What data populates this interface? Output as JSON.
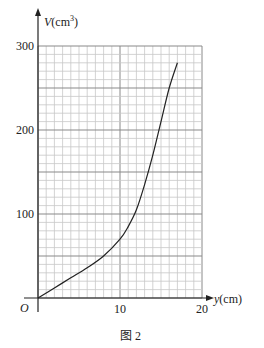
{
  "chart_data": {
    "type": "line",
    "title": "",
    "caption": "图 2",
    "xlabel": "y(cm)",
    "ylabel": "V(cm³)",
    "origin_label": "O",
    "xlim": [
      0,
      20
    ],
    "ylim": [
      0,
      300
    ],
    "x_ticks": [
      10,
      20
    ],
    "y_ticks": [
      100,
      200,
      300
    ],
    "x_tick_labels": [
      "10",
      "20"
    ],
    "y_tick_labels": [
      "100",
      "200",
      "300"
    ],
    "grid": true,
    "x_minor_step": 1,
    "y_minor_step": 10,
    "y_major_step": 50,
    "x_major_step": 10,
    "series": [
      {
        "name": "V",
        "x": [
          0,
          2,
          4,
          6,
          8,
          10,
          11,
          12,
          13,
          14,
          15,
          16,
          17
        ],
        "values": [
          0,
          12,
          24,
          36,
          50,
          70,
          85,
          105,
          135,
          170,
          210,
          250,
          280
        ]
      }
    ]
  },
  "colors": {
    "grid_minor": "#c8c8c8",
    "grid_major": "#8a8a8a",
    "axis": "#222222",
    "curve": "#222222"
  }
}
